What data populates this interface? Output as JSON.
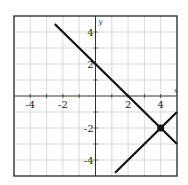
{
  "chart_data": {
    "type": "line",
    "title": "",
    "xlabel": "x",
    "ylabel": "y",
    "xlim": [
      -5,
      5
    ],
    "ylim": [
      -5,
      5
    ],
    "grid": true,
    "x_ticks": [
      -4,
      -2,
      2,
      4
    ],
    "y_ticks": [
      4,
      2,
      -2,
      -4
    ],
    "x_tick_labels": [
      "-4",
      "-2",
      "2",
      "4"
    ],
    "y_tick_labels": [
      "4",
      "2",
      "-2",
      "-4"
    ],
    "series": [
      {
        "name": "y = -x + 2",
        "slope": -1,
        "intercept": 2,
        "points": [
          [
            -2.5,
            4.5
          ],
          [
            5,
            -3
          ]
        ]
      },
      {
        "name": "y = x - 6",
        "slope": 1,
        "intercept": -6,
        "points": [
          [
            1.2,
            -4.8
          ],
          [
            5,
            -1
          ]
        ]
      }
    ],
    "annotations": [
      {
        "type": "point",
        "label": "intersection",
        "x": 4,
        "y": -2
      }
    ],
    "colors": {
      "line": "#111111",
      "grid": "#cfcfcf",
      "frame": "#222222"
    }
  }
}
